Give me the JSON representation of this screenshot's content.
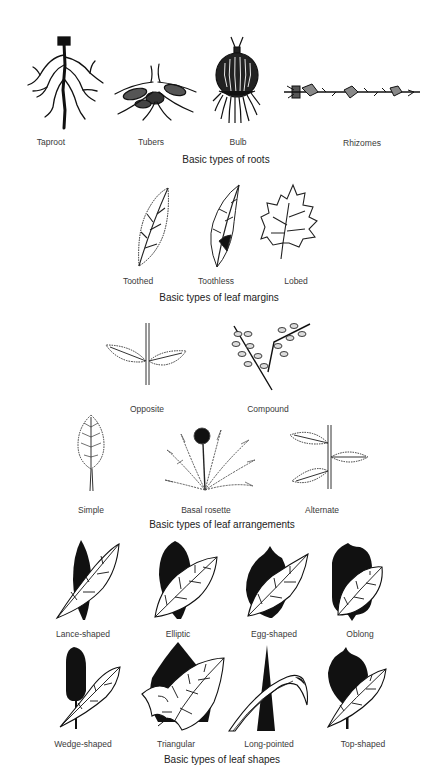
{
  "sections": [
    {
      "id": "roots",
      "caption": "Basic types of roots",
      "items": [
        {
          "label": "Taproot",
          "icon": "taproot-icon"
        },
        {
          "label": "Tubers",
          "icon": "tubers-icon"
        },
        {
          "label": "Bulb",
          "icon": "bulb-icon"
        },
        {
          "label": "Rhizomes",
          "icon": "rhizomes-icon"
        }
      ]
    },
    {
      "id": "leaf-margins",
      "caption": "Basic types of leaf margins",
      "items": [
        {
          "label": "Toothed",
          "icon": "toothed-leaf-icon"
        },
        {
          "label": "Toothless",
          "icon": "toothless-leaf-icon"
        },
        {
          "label": "Lobed",
          "icon": "lobed-leaf-icon"
        }
      ]
    },
    {
      "id": "leaf-arrangements",
      "caption": "Basic types of leaf arrangements",
      "items": [
        {
          "label": "Opposite",
          "icon": "opposite-arrangement-icon"
        },
        {
          "label": "Compound",
          "icon": "compound-arrangement-icon"
        },
        {
          "label": "Simple",
          "icon": "simple-leaf-icon"
        },
        {
          "label": "Basal rosette",
          "icon": "basal-rosette-icon"
        },
        {
          "label": "Alternate",
          "icon": "alternate-arrangement-icon"
        }
      ]
    },
    {
      "id": "leaf-shapes",
      "caption": "Basic types of leaf shapes",
      "items": [
        {
          "label": "Lance-shaped",
          "icon": "lance-shaped-leaf-icon"
        },
        {
          "label": "Elliptic",
          "icon": "elliptic-leaf-icon"
        },
        {
          "label": "Egg-shaped",
          "icon": "egg-shaped-leaf-icon"
        },
        {
          "label": "Oblong",
          "icon": "oblong-leaf-icon"
        },
        {
          "label": "Wedge-shaped",
          "icon": "wedge-shaped-leaf-icon"
        },
        {
          "label": "Triangular",
          "icon": "triangular-leaf-icon"
        },
        {
          "label": "Long-pointed",
          "icon": "long-pointed-leaf-icon"
        },
        {
          "label": "Top-shaped",
          "icon": "top-shaped-leaf-icon"
        }
      ]
    }
  ],
  "colors": {
    "ink": "#111111",
    "background": "#ffffff",
    "label": "#3a3a3a"
  }
}
